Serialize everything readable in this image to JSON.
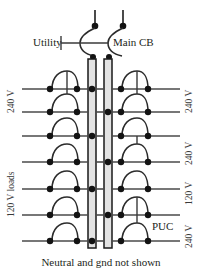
{
  "diagram": {
    "caption": "Neutral and gnd not shown",
    "labels": {
      "utility": "Utility",
      "main_cb": "Main CB",
      "puc": "PUC"
    },
    "left_labels": [
      {
        "text": "240 V",
        "rows": [
          1,
          2
        ]
      },
      {
        "text": "120 V loads",
        "rows": [
          4,
          5,
          6
        ]
      }
    ],
    "right_labels": [
      {
        "text": "240 V",
        "rows": [
          1,
          2
        ]
      },
      {
        "text": "240 V",
        "rows": [
          3,
          4
        ]
      },
      {
        "text": "120 V",
        "rows": [
          5
        ]
      },
      {
        "text": "240 V",
        "rows": [
          6,
          7
        ]
      }
    ],
    "colors": {
      "wire": "#4a4a4a",
      "node": "#131313",
      "busbar_fill": "#e3e3e3",
      "busbar_stroke": "#1a1a1a",
      "text": "#231f20",
      "background": "#ffffff"
    },
    "geometry": {
      "width": 202,
      "height": 276,
      "bus_left": {
        "x": 88,
        "width": 8,
        "y_top": 59,
        "y_bottom": 248
      },
      "bus_right": {
        "x": 104,
        "width": 8,
        "y_top": 59,
        "y_bottom": 248
      },
      "row_y": [
        89,
        112,
        136,
        162,
        189,
        215,
        241
      ],
      "node_x_left_outer": 50,
      "node_x_left_inner": 75,
      "node_x_right_inner": 122,
      "node_x_right_outer": 147,
      "wire_left_end": 22,
      "wire_right_end": 180
    },
    "circuits": [
      {
        "row": 1,
        "left_breaker": "single",
        "right_breaker": "double-top",
        "rating": "240 V"
      },
      {
        "row": 2,
        "left_breaker": "double",
        "right_breaker": "double-bottom",
        "rating": "240 V"
      },
      {
        "row": 3,
        "left_breaker": "single",
        "right_breaker": "single",
        "rating": "240 V"
      },
      {
        "row": 4,
        "left_breaker": "single",
        "right_breaker": "double-top",
        "rating": "240 V"
      },
      {
        "row": 5,
        "left_breaker": "single",
        "right_breaker": "single",
        "rating": "120 V"
      },
      {
        "row": 6,
        "left_breaker": "single",
        "right_breaker": "double-top",
        "rating": "240 V"
      },
      {
        "row": 7,
        "left_breaker": "single",
        "right_breaker": "double-bottom",
        "rating": "240 V"
      }
    ],
    "main_breaker": {
      "feed_lines": 2,
      "feed_x": [
        95,
        123
      ],
      "feed_y_top": 10,
      "feed_node_y": 26,
      "tie_y": 42,
      "output_node_y": 58
    }
  }
}
